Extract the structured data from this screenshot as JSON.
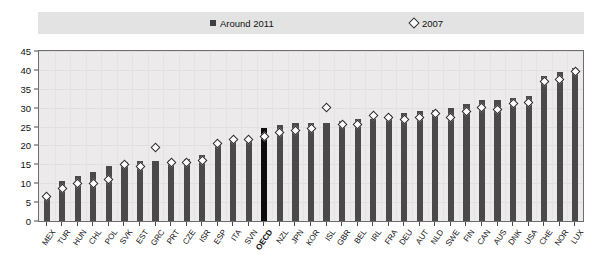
{
  "legend": {
    "items": [
      {
        "label": "Around 2011",
        "marker": "filled-square-icon",
        "color": "#3f3f3f"
      },
      {
        "label": "2007",
        "marker": "open-diamond-icon",
        "color": "#333333"
      }
    ]
  },
  "chart_data": {
    "type": "bar",
    "title": "",
    "xlabel": "",
    "ylabel": "",
    "ylim": [
      0,
      45
    ],
    "ytick_step": 5,
    "yticks": [
      0,
      5,
      10,
      15,
      20,
      25,
      30,
      35,
      40,
      45
    ],
    "grid": true,
    "legend_position": "top",
    "highlight_category": "OECD",
    "highlight_color": "#0d0d0d",
    "bar_color": "#4a4a4a",
    "categories": [
      "MEX",
      "TUR",
      "HUN",
      "CHL",
      "POL",
      "SVK",
      "EST",
      "GRC",
      "PRT",
      "CZE",
      "ISR",
      "ESP",
      "ITA",
      "SVN",
      "OECD",
      "NZL",
      "JPN",
      "KOR",
      "ISL",
      "GBR",
      "BEL",
      "IRL",
      "FRA",
      "DEU",
      "AUT",
      "NLD",
      "SWE",
      "FIN",
      "CAN",
      "AUS",
      "DNK",
      "USA",
      "CHE",
      "NOR",
      "LUX"
    ],
    "series": [
      {
        "name": "Around 2011",
        "type": "bar",
        "values": [
          7.0,
          10.5,
          12.0,
          13.0,
          14.5,
          15.5,
          16.0,
          16.0,
          16.2,
          16.5,
          17.5,
          20.0,
          21.5,
          22.0,
          24.5,
          25.5,
          26.0,
          26.0,
          26.0,
          26.5,
          27.0,
          27.0,
          28.0,
          28.5,
          29.0,
          29.5,
          30.0,
          31.0,
          32.0,
          32.0,
          32.5,
          33.0,
          38.5,
          39.5,
          40.5
        ]
      },
      {
        "name": "2007",
        "type": "scatter",
        "values": [
          6.5,
          8.5,
          10.0,
          10.0,
          11.0,
          15.0,
          14.5,
          19.5,
          15.5,
          15.5,
          16.0,
          20.5,
          21.5,
          21.5,
          22.5,
          23.5,
          24.0,
          24.5,
          30.0,
          25.5,
          25.5,
          28.0,
          27.5,
          27.0,
          27.5,
          28.5,
          27.5,
          29.0,
          30.0,
          29.5,
          31.0,
          31.5,
          37.0,
          37.5,
          39.5
        ]
      }
    ]
  }
}
